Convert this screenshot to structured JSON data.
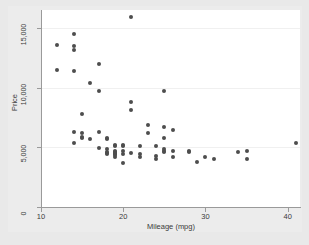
{
  "chart_data": {
    "type": "scatter",
    "title": "",
    "xlabel": "Mileage (mpg)",
    "ylabel": "Price",
    "xlim": [
      10,
      41.5
    ],
    "ylim": [
      0,
      16500
    ],
    "xticks": [
      10,
      20,
      30,
      40
    ],
    "xtick_labels": [
      "10",
      "20",
      "30",
      "40"
    ],
    "yticks": [
      0,
      5000,
      10000,
      15000
    ],
    "ytick_labels": [
      "0",
      "5,000",
      "10,000",
      "15,000"
    ],
    "grid": "horizontal",
    "legend": "none",
    "marker_color": "#4d4d4d",
    "plot_background": "#ffffff",
    "figure_background": "#e9e9e9",
    "points": [
      {
        "x": 12.0,
        "y": 13594
      },
      {
        "x": 12.0,
        "y": 11497
      },
      {
        "x": 14.0,
        "y": 14500
      },
      {
        "x": 14.0,
        "y": 13466
      },
      {
        "x": 14.0,
        "y": 13156
      },
      {
        "x": 14.0,
        "y": 11385
      },
      {
        "x": 14.0,
        "y": 6303
      },
      {
        "x": 14.0,
        "y": 5397
      },
      {
        "x": 15.0,
        "y": 7827
      },
      {
        "x": 15.0,
        "y": 6171
      },
      {
        "x": 15.0,
        "y": 5899
      },
      {
        "x": 15.0,
        "y": 5788
      },
      {
        "x": 16.0,
        "y": 10372
      },
      {
        "x": 16.0,
        "y": 5705
      },
      {
        "x": 17.0,
        "y": 12000
      },
      {
        "x": 17.0,
        "y": 9735
      },
      {
        "x": 17.0,
        "y": 6285
      },
      {
        "x": 17.0,
        "y": 4934
      },
      {
        "x": 18.0,
        "y": 5788
      },
      {
        "x": 18.0,
        "y": 5705
      },
      {
        "x": 18.0,
        "y": 4816
      },
      {
        "x": 18.0,
        "y": 4589
      },
      {
        "x": 18.0,
        "y": 4482
      },
      {
        "x": 18.0,
        "y": 4424
      },
      {
        "x": 19.0,
        "y": 5222
      },
      {
        "x": 19.0,
        "y": 5104
      },
      {
        "x": 19.0,
        "y": 4697
      },
      {
        "x": 19.0,
        "y": 4647
      },
      {
        "x": 19.0,
        "y": 4504
      },
      {
        "x": 19.0,
        "y": 4425
      },
      {
        "x": 19.0,
        "y": 4389
      },
      {
        "x": 19.0,
        "y": 4187
      },
      {
        "x": 20.0,
        "y": 5222
      },
      {
        "x": 20.0,
        "y": 5079
      },
      {
        "x": 20.0,
        "y": 4723
      },
      {
        "x": 20.0,
        "y": 4453
      },
      {
        "x": 20.0,
        "y": 3667
      },
      {
        "x": 21.0,
        "y": 15906
      },
      {
        "x": 21.0,
        "y": 8814
      },
      {
        "x": 21.0,
        "y": 8129
      },
      {
        "x": 21.0,
        "y": 4482
      },
      {
        "x": 22.0,
        "y": 5104
      },
      {
        "x": 22.0,
        "y": 4425
      },
      {
        "x": 22.0,
        "y": 4172
      },
      {
        "x": 23.0,
        "y": 6850
      },
      {
        "x": 23.0,
        "y": 6229
      },
      {
        "x": 24.0,
        "y": 5079
      },
      {
        "x": 24.0,
        "y": 4296
      },
      {
        "x": 24.0,
        "y": 3984
      },
      {
        "x": 25.0,
        "y": 9690
      },
      {
        "x": 25.0,
        "y": 6707
      },
      {
        "x": 25.0,
        "y": 5799
      },
      {
        "x": 25.0,
        "y": 4816
      },
      {
        "x": 25.0,
        "y": 4697
      },
      {
        "x": 25.0,
        "y": 4589
      },
      {
        "x": 26.0,
        "y": 6486
      },
      {
        "x": 26.0,
        "y": 4698
      },
      {
        "x": 26.0,
        "y": 4187
      },
      {
        "x": 28.0,
        "y": 4723
      },
      {
        "x": 28.0,
        "y": 4589
      },
      {
        "x": 29.0,
        "y": 3748
      },
      {
        "x": 30.0,
        "y": 4195
      },
      {
        "x": 31.0,
        "y": 4060
      },
      {
        "x": 34.0,
        "y": 4589
      },
      {
        "x": 35.0,
        "y": 4697
      },
      {
        "x": 35.0,
        "y": 4060
      },
      {
        "x": 41.0,
        "y": 5397
      }
    ]
  }
}
